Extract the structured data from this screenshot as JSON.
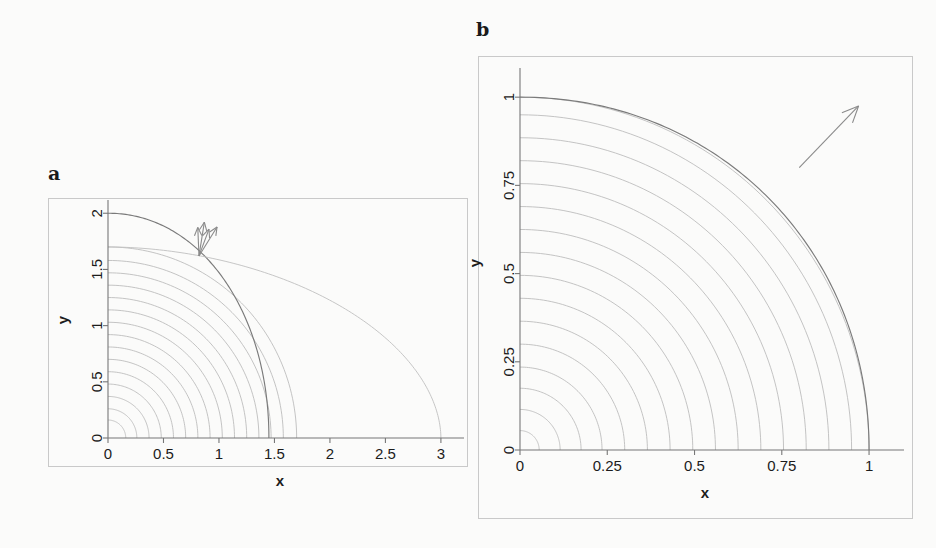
{
  "figure": {
    "background_color": "#fbfbfa",
    "contour_color": "#b9b9b9",
    "constraint_color": "#7a7a7a",
    "axis_color": "#777777",
    "frame_color": "#c9c9c9"
  },
  "panels": [
    {
      "id": "a",
      "letter": "a",
      "xlabel": "x",
      "ylabel": "y",
      "xticks": [
        "0",
        "0.5",
        "1",
        "1.5",
        "2",
        "2.5",
        "3"
      ],
      "xtick_values": [
        0,
        0.5,
        1,
        1.5,
        2,
        2.5,
        3
      ],
      "yticks": [
        "0",
        "0.5",
        "1",
        "1.5",
        "2"
      ],
      "ytick_values": [
        0,
        0.5,
        1,
        1.5,
        2
      ],
      "xlim": [
        0,
        3.1
      ],
      "ylim": [
        0,
        2.1
      ],
      "arrow": {
        "from": [
          0.82,
          1.62
        ],
        "to": [
          0.9,
          1.92
        ],
        "prongs": 4
      }
    },
    {
      "id": "b",
      "letter": "b",
      "xlabel": "x",
      "ylabel": "y",
      "xticks": [
        "0",
        "0.25",
        "0.5",
        "0.75",
        "1"
      ],
      "xtick_values": [
        0,
        0.25,
        0.5,
        0.75,
        1
      ],
      "yticks": [
        "0",
        "0.25",
        "0.5",
        "0.75",
        "1"
      ],
      "ytick_values": [
        0,
        0.25,
        0.5,
        0.75,
        1
      ],
      "xlim": [
        0,
        1.06
      ],
      "ylim": [
        0,
        1.06
      ],
      "arrow": {
        "from": [
          0.8,
          0.8
        ],
        "to": [
          0.97,
          0.975
        ],
        "prongs": 1
      }
    }
  ],
  "chart_data": [
    {
      "type": "line",
      "panel": "a",
      "title": "a",
      "xlabel": "x",
      "ylabel": "y",
      "xlim": [
        0,
        3.1
      ],
      "ylim": [
        0,
        2.1
      ],
      "grid": false,
      "legend": "none",
      "description": "Quarter-circle contour family of an objective function with two constraint boundaries and a multi-pronged gradient arrow at the tangency point.",
      "contours": {
        "family": "quarter-circles centred at origin",
        "radii": [
          0.16,
          0.26,
          0.37,
          0.48,
          0.59,
          0.7,
          0.81,
          0.92,
          1.03,
          1.14,
          1.25,
          1.36,
          1.47,
          1.58,
          1.7
        ]
      },
      "curves": [
        {
          "name": "constraint-dark",
          "kind": "ellipse-arc",
          "x_intercept": 1.45,
          "y_intercept": 2.0,
          "style": "dark"
        },
        {
          "name": "constraint-light",
          "kind": "ellipse-arc",
          "x_intercept": 3.0,
          "y_intercept": 1.7,
          "style": "light"
        }
      ],
      "annotations": [
        {
          "type": "arrow",
          "tail": [
            0.82,
            1.62
          ],
          "head": [
            0.9,
            1.92
          ],
          "label": ""
        }
      ]
    },
    {
      "type": "line",
      "panel": "b",
      "title": "b",
      "xlabel": "x",
      "ylabel": "y",
      "xlim": [
        0,
        1.06
      ],
      "ylim": [
        0,
        1.06
      ],
      "grid": false,
      "legend": "none",
      "description": "Quarter-circle contour family inside the unit square with the unit-circle constraint boundary and a single gradient arrow at the tangency point.",
      "contours": {
        "family": "quarter-circles centred at origin",
        "radii": [
          0.055,
          0.115,
          0.175,
          0.235,
          0.3,
          0.365,
          0.43,
          0.495,
          0.56,
          0.625,
          0.69,
          0.755,
          0.82,
          0.885,
          0.95,
          1.0
        ]
      },
      "curves": [
        {
          "name": "constraint-dark",
          "kind": "ellipse-arc",
          "x_intercept": 1.0,
          "y_intercept": 1.0,
          "style": "dark"
        }
      ],
      "annotations": [
        {
          "type": "arrow",
          "tail": [
            0.8,
            0.8
          ],
          "head": [
            0.97,
            0.975
          ],
          "label": ""
        }
      ]
    }
  ]
}
